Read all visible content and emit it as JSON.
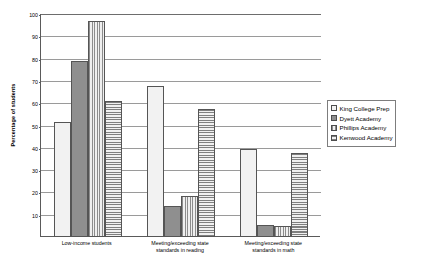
{
  "chart_data": {
    "type": "bar",
    "title": "",
    "xlabel": "",
    "ylabel": "Percentage of students",
    "ylim": [
      0,
      100
    ],
    "ytick_step": 10,
    "yticks": [
      100,
      90,
      80,
      70,
      60,
      50,
      40,
      30,
      20,
      10,
      0
    ],
    "grid": true,
    "legend_position": "right",
    "categories": [
      "Low-income students",
      "Meeting/exceeding state standards in reading",
      "Meeting/exceeding state standards in math"
    ],
    "category_lines": [
      [
        "Low-income students"
      ],
      [
        "Meeting/exceeding state",
        "standards in reading"
      ],
      [
        "Meeting/exceeding state",
        "standards in math"
      ]
    ],
    "series": [
      {
        "name": "King College Prep",
        "pattern": "dots",
        "values": [
          51.5,
          67.5,
          39.5
        ]
      },
      {
        "name": "Dyett Academy",
        "pattern": "solid",
        "values": [
          79,
          14,
          5.5
        ]
      },
      {
        "name": "Phillips Academy",
        "pattern": "vertical-lines",
        "values": [
          97,
          18.5,
          5
        ]
      },
      {
        "name": "Kenwood Academy",
        "pattern": "horizontal-lines",
        "values": [
          61,
          57.5,
          37.5
        ]
      }
    ]
  },
  "colors": {
    "axis": "#5a5a5a",
    "gridline": "#9a9a9a",
    "bar_outline": "#555555",
    "background": "#ffffff",
    "text": "#000000"
  }
}
